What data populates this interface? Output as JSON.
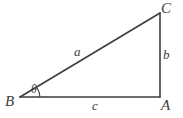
{
  "figure": {
    "kind": "right-triangle-diagram",
    "background_color": "#ffffff",
    "stroke_color": "#3d3d3d",
    "text_color": "#3d3d3d",
    "vertices": {
      "A": {
        "label": "A",
        "x": 160,
        "y": 97
      },
      "B": {
        "label": "B",
        "x": 20,
        "y": 97
      },
      "C": {
        "label": "C",
        "x": 160,
        "y": 13
      }
    },
    "sides": {
      "hypotenuse": {
        "label": "a",
        "from": "B",
        "to": "C"
      },
      "vertical": {
        "label": "b",
        "from": "A",
        "to": "C"
      },
      "base": {
        "label": "c",
        "from": "B",
        "to": "A"
      }
    },
    "angles": {
      "at_B": {
        "label": "θ",
        "name": "theta"
      }
    }
  }
}
